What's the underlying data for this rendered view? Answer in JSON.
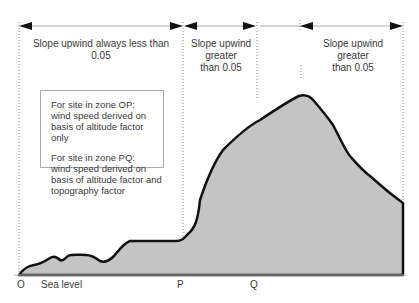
{
  "zones": [
    {
      "label": "Slope upwind always less than 0.05"
    },
    {
      "label_lines": [
        "Slope upwind",
        "greater",
        "than 0.05"
      ]
    },
    {
      "label_lines": [
        "Slope upwind",
        "greater",
        "than 0.05"
      ]
    }
  ],
  "info_box": {
    "op": {
      "line1": "For site in zone OP:",
      "line2": "wind speed derived on",
      "line3": "basis of altitude factor only"
    },
    "pq": {
      "line1": "For site in zone PQ:",
      "line2": "wind speed derived on",
      "line3": "basis of altitude factor and",
      "line4": "topography factor"
    }
  },
  "axis": {
    "o": "O",
    "sea_level": "Sea level",
    "p": "P",
    "q": "Q"
  },
  "colors": {
    "terrain_fill": "#c4c4c4",
    "terrain_line": "#111111",
    "guide": "#999999"
  }
}
